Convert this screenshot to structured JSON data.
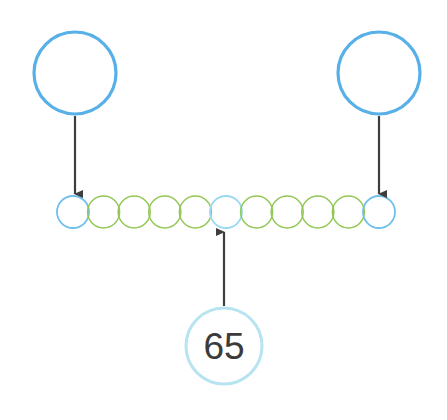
{
  "canvas": {
    "width": 447,
    "height": 420,
    "background": "#ffffff"
  },
  "colors": {
    "node_blue": "#58b0e8",
    "node_blue_light": "#8ed2f0",
    "node_green": "#93c756",
    "bubble_ring": "#b8e4f2",
    "arrow": "#3e3e3e",
    "text": "#3b3b3b"
  },
  "top_nodes": [
    {
      "name": "left-parent-node",
      "label": "",
      "cx": 75,
      "cy": 73,
      "r": 41,
      "stroke": "#58b0e8",
      "stroke_width": 3.2
    },
    {
      "name": "right-parent-node",
      "label": "",
      "cx": 379,
      "cy": 73,
      "r": 41,
      "stroke": "#58b0e8",
      "stroke_width": 3.2
    }
  ],
  "chain": {
    "name": "circle-chain",
    "count": 11,
    "cy": 212,
    "r": 16,
    "start_cx": 73,
    "spacing": 30.6,
    "nodes": [
      {
        "index": 0,
        "label": "",
        "color": "#6fc0ea",
        "stroke_width": 1.8,
        "kind": "endpoint"
      },
      {
        "index": 1,
        "label": "",
        "color": "#93c756",
        "stroke_width": 1.5,
        "kind": "middle"
      },
      {
        "index": 2,
        "label": "",
        "color": "#93c756",
        "stroke_width": 1.5,
        "kind": "middle"
      },
      {
        "index": 3,
        "label": "",
        "color": "#93c756",
        "stroke_width": 1.5,
        "kind": "middle"
      },
      {
        "index": 4,
        "label": "",
        "color": "#93c756",
        "stroke_width": 1.5,
        "kind": "middle"
      },
      {
        "index": 5,
        "label": "",
        "color": "#9ad9f2",
        "stroke_width": 1.8,
        "kind": "center"
      },
      {
        "index": 6,
        "label": "",
        "color": "#93c756",
        "stroke_width": 1.5,
        "kind": "middle"
      },
      {
        "index": 7,
        "label": "",
        "color": "#93c756",
        "stroke_width": 1.5,
        "kind": "middle"
      },
      {
        "index": 8,
        "label": "",
        "color": "#93c756",
        "stroke_width": 1.5,
        "kind": "middle"
      },
      {
        "index": 9,
        "label": "",
        "color": "#93c756",
        "stroke_width": 1.5,
        "kind": "middle"
      },
      {
        "index": 10,
        "label": "",
        "color": "#6fc0ea",
        "stroke_width": 1.8,
        "kind": "endpoint"
      }
    ]
  },
  "value_bubble": {
    "name": "value-bubble",
    "label": "65",
    "cx": 224,
    "cy": 346,
    "r": 38,
    "stroke": "#b8e4f2",
    "stroke_width": 3.0,
    "text_color": "#3b3b3b"
  },
  "arrows": [
    {
      "name": "arrow-left-parent-to-chain",
      "direction": "down",
      "x1": 75,
      "y1": 116,
      "x2": 75,
      "y2": 194,
      "color": "#3e3e3e",
      "width": 2.2
    },
    {
      "name": "arrow-right-parent-to-chain",
      "direction": "down",
      "x1": 379,
      "y1": 116,
      "x2": 379,
      "y2": 194,
      "color": "#3e3e3e",
      "width": 2.2
    },
    {
      "name": "arrow-value-bubble-to-center-node",
      "direction": "up",
      "x1": 224,
      "y1": 306,
      "x2": 224,
      "y2": 232,
      "color": "#3e3e3e",
      "width": 2.2
    }
  ]
}
